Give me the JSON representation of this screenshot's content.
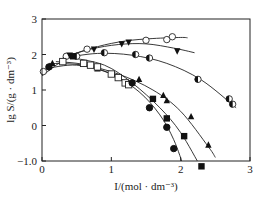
{
  "chart_data": {
    "type": "scatter",
    "title": "",
    "xlabel": "I/(mol · dm⁻³)",
    "ylabel": "lg S/(g · dm⁻³)",
    "xlim": [
      0,
      3
    ],
    "ylim": [
      -1.0,
      3
    ],
    "xticks": [
      "0",
      "1",
      "2",
      "3"
    ],
    "yticks": [
      "−1.0",
      "0",
      "1",
      "2",
      "3"
    ],
    "grid": false,
    "legend": "none",
    "series": [
      {
        "name": "open-circle",
        "marker": "circle-open",
        "x": [
          0.02,
          0.35,
          0.65,
          1.5,
          1.8,
          1.88
        ],
        "y": [
          1.52,
          1.95,
          2.15,
          2.4,
          2.42,
          2.5
        ],
        "fit": [
          [
            0,
            1.4
          ],
          [
            0.4,
            1.95
          ],
          [
            0.8,
            2.22
          ],
          [
            1.2,
            2.38
          ],
          [
            1.6,
            2.45
          ],
          [
            2.0,
            2.48
          ],
          [
            2.1,
            2.47
          ]
        ]
      },
      {
        "name": "filled-triangle-down",
        "marker": "triangle-down-filled",
        "x": [
          0.4,
          0.75,
          1.15,
          1.25,
          1.95
        ],
        "y": [
          1.98,
          2.15,
          2.3,
          2.35,
          2.1
        ],
        "fit": [
          [
            0.3,
            1.92
          ],
          [
            0.7,
            2.15
          ],
          [
            1.1,
            2.28
          ],
          [
            1.5,
            2.3
          ],
          [
            1.9,
            2.18
          ],
          [
            2.2,
            2.05
          ]
        ]
      },
      {
        "name": "half-filled-circle",
        "marker": "circle-half",
        "x": [
          0.5,
          0.9,
          1.35,
          1.55,
          2.25,
          2.7,
          2.75
        ],
        "y": [
          1.95,
          2.05,
          2.0,
          1.9,
          1.3,
          0.75,
          0.6
        ],
        "fit": [
          [
            0.3,
            1.9
          ],
          [
            0.8,
            2.03
          ],
          [
            1.3,
            1.98
          ],
          [
            1.8,
            1.75
          ],
          [
            2.3,
            1.28
          ],
          [
            2.8,
            0.5
          ]
        ]
      },
      {
        "name": "filled-triangle-up",
        "marker": "triangle-up-filled",
        "x": [
          0.15,
          0.8,
          1.4,
          1.75,
          1.8,
          2.15,
          2.4
        ],
        "y": [
          1.75,
          1.6,
          1.3,
          0.85,
          0.7,
          0.25,
          -0.55
        ],
        "fit": [
          [
            0.1,
            1.75
          ],
          [
            0.6,
            1.7
          ],
          [
            1.1,
            1.45
          ],
          [
            1.6,
            1.0
          ],
          [
            2.0,
            0.4
          ],
          [
            2.4,
            -0.6
          ],
          [
            2.5,
            -0.9
          ]
        ]
      },
      {
        "name": "open-square",
        "marker": "square-open",
        "x": [
          0.3,
          0.6,
          0.7,
          0.8,
          1.0,
          1.1,
          1.2,
          1.25
        ],
        "y": [
          1.8,
          1.75,
          1.7,
          1.65,
          1.45,
          1.35,
          1.2,
          1.15
        ],
        "fit": [
          [
            0.2,
            1.8
          ],
          [
            0.6,
            1.72
          ],
          [
            1.0,
            1.45
          ],
          [
            1.3,
            1.1
          ]
        ]
      },
      {
        "name": "filled-square",
        "marker": "square-filled",
        "x": [
          0.45,
          1.6,
          1.8,
          2.05,
          2.3
        ],
        "y": [
          1.95,
          0.75,
          0.2,
          -0.3,
          -1.15
        ],
        "fit": [
          [
            0.4,
            1.92
          ],
          [
            0.9,
            1.7
          ],
          [
            1.3,
            1.2
          ],
          [
            1.7,
            0.5
          ],
          [
            2.0,
            -0.2
          ],
          [
            2.3,
            -1.2
          ],
          [
            2.4,
            -1.45
          ]
        ]
      },
      {
        "name": "filled-circle",
        "marker": "circle-filled",
        "x": [
          0.1,
          1.3,
          1.55,
          1.8,
          1.9
        ],
        "y": [
          1.65,
          1.2,
          0.5,
          -0.05,
          -0.65
        ],
        "fit": [
          [
            0.05,
            1.6
          ],
          [
            0.5,
            1.7
          ],
          [
            1.0,
            1.45
          ],
          [
            1.4,
            0.95
          ],
          [
            1.7,
            0.3
          ],
          [
            1.9,
            -0.4
          ],
          [
            2.05,
            -1.2
          ]
        ]
      }
    ]
  }
}
